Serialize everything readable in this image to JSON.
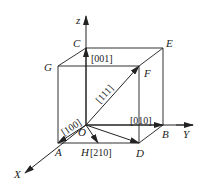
{
  "diagram": {
    "axes": {
      "x": "X",
      "y": "Y",
      "z": "z"
    },
    "points": {
      "origin": "O",
      "A": "A",
      "B": "B",
      "C": "C",
      "D": "D",
      "E": "E",
      "F": "F",
      "G": "G",
      "H": "H"
    },
    "directions": {
      "d001": "[001]",
      "d111": "[111]",
      "d100": "[100]",
      "d010": "[010]",
      "d210": "[210]"
    },
    "colors": {
      "line": "#333333",
      "background": "#ffffff"
    }
  }
}
